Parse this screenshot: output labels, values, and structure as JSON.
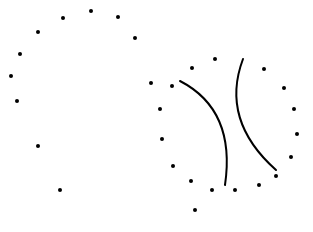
{
  "diagram": {
    "width": 313,
    "height": 232,
    "background": "#ffffff",
    "ink": "#000000",
    "dot_radius": 2,
    "stroke_width": 2,
    "left_cluster": {
      "dots": [
        [
          91,
          11
        ],
        [
          63,
          18
        ],
        [
          118,
          17
        ],
        [
          38,
          32
        ],
        [
          135,
          38
        ],
        [
          20,
          54
        ],
        [
          11,
          76
        ],
        [
          17,
          101
        ],
        [
          38,
          146
        ],
        [
          60,
          190
        ]
      ]
    },
    "right_cluster": {
      "dots": [
        [
          151,
          83
        ],
        [
          172,
          86
        ],
        [
          192,
          68
        ],
        [
          215,
          59
        ],
        [
          264,
          69
        ],
        [
          284,
          88
        ],
        [
          160,
          109
        ],
        [
          294,
          109
        ],
        [
          297,
          134
        ],
        [
          162,
          139
        ],
        [
          291,
          157
        ],
        [
          173,
          166
        ],
        [
          276,
          176
        ],
        [
          191,
          181
        ],
        [
          259,
          185
        ],
        [
          212,
          190
        ],
        [
          235,
          190
        ],
        [
          195,
          210
        ]
      ],
      "arcs": [
        {
          "name": "left-arc",
          "d": "M180,81 Q236,110 225,185"
        },
        {
          "name": "right-arc",
          "d": "M243,59 Q220,120 276,170"
        }
      ]
    }
  }
}
